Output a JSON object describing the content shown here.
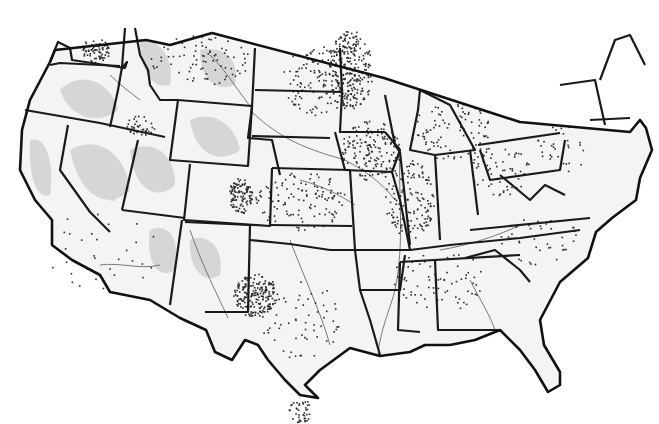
{
  "map": {
    "title": "",
    "subject": "Contiguous United States dot-density map",
    "colors": {
      "background": "#ffffff",
      "land": "#f4f4f4",
      "shaded_region": "#d6d6d6",
      "boundary": "#1a1a1a",
      "river": "#6a6a6a",
      "dot": "#2a2a2a"
    },
    "outline": "M146,40 L170,45 L212,33 L384,78 L520,122 L630,132 L640,120 L646,128 L652,150 L640,178 L636,200 L612,218 L596,232 L588,258 L560,282 L540,320 L544,345 L560,372 L560,385 L548,392 L535,370 L520,350 L500,330 L475,340 L450,345 L425,345 L410,352 L380,356 L350,348 L320,370 L305,385 L318,398 L300,395 L285,380 L268,360 L258,345 L245,340 L232,360 L215,352 L206,330 L180,318 L150,300 L110,292 L100,275 L72,260 L52,245 L52,220 L35,200 L20,170 L22,130 L30,100 L50,62 L55,50 Z",
    "states": [
      {
        "name": "washington",
        "path": "M50,62 L58,42 L70,48 L72,60 L125,68 L127,62 L122,68 L122,70"
      },
      {
        "name": "wa-or",
        "path": "M50,65 L60,63 L120,66"
      },
      {
        "name": "or-ca-nv",
        "path": "M25,110 L100,123 L165,137"
      },
      {
        "name": "id-west",
        "path": "M125,28 L122,67 L118,90 L110,127"
      },
      {
        "name": "id-mt",
        "path": "M135,28 L140,55 L148,70 L150,85 L160,100 L178,100"
      },
      {
        "name": "mt-south",
        "path": "M178,100 L252,106"
      },
      {
        "name": "wy",
        "path": "M178,100 L170,160 L248,166 L252,106"
      },
      {
        "name": "nv-east",
        "path": "M138,140 L122,210"
      },
      {
        "name": "nv-ca",
        "path": "M68,125 L60,170 L90,212 L110,232"
      },
      {
        "name": "ut-az",
        "path": "M122,210 L185,218"
      },
      {
        "name": "co",
        "path": "M190,164 L184,220 L270,226 L272,168"
      },
      {
        "name": "az-nm",
        "path": "M182,220 L170,305"
      },
      {
        "name": "nm-tx",
        "path": "M185,222 L250,225 L248,312 L205,312"
      },
      {
        "name": "nd-sd-ne",
        "path": "M255,48 L252,107 L248,138 L272,140 L280,175"
      },
      {
        "name": "nd-sd",
        "path": "M255,90 L342,92"
      },
      {
        "name": "sd-ne",
        "path": "M252,136 L330,138"
      },
      {
        "name": "ne-ks",
        "path": "M272,168 L350,170"
      },
      {
        "name": "ks-ok",
        "path": "M270,225 L352,226"
      },
      {
        "name": "ok-tx",
        "path": "M250,240 L290,244 L330,250 L355,250"
      },
      {
        "name": "mn",
        "path": "M340,48 L342,92 L340,132 L385,132"
      },
      {
        "name": "ia",
        "path": "M335,132 L345,170 L392,172 L400,150 L385,132"
      },
      {
        "name": "mo",
        "path": "M350,170 L355,250 L410,250 L400,200 L392,172"
      },
      {
        "name": "ar-la",
        "path": "M355,250 L360,290 L400,290 L405,255"
      },
      {
        "name": "la",
        "path": "M360,290 L370,320 L380,355"
      },
      {
        "name": "ms-al",
        "path": "M400,262 L398,330 L420,332"
      },
      {
        "name": "al-ga",
        "path": "M435,260 L438,330 L498,330"
      },
      {
        "name": "ga-sc-fl",
        "path": "M465,258 L495,250 L520,270 L530,282"
      },
      {
        "name": "tn",
        "path": "M400,262 L520,255"
      },
      {
        "name": "ky-tn-nc",
        "path": "M410,250 L450,245 L520,238 L580,230"
      },
      {
        "name": "wi-il",
        "path": "M385,95 L395,145 L400,152"
      },
      {
        "name": "il-in",
        "path": "M400,152 L410,245"
      },
      {
        "name": "in-oh",
        "path": "M435,155 L440,240"
      },
      {
        "name": "oh-pa",
        "path": "M470,150 L478,215"
      },
      {
        "name": "mi-lower",
        "path": "M420,90 L450,105 L475,150 L435,155 L410,150 L418,110 Z"
      },
      {
        "name": "pa-ny",
        "path": "M478,145 L560,133"
      },
      {
        "name": "pa",
        "path": "M480,150 L490,180 L560,170 L565,140"
      },
      {
        "name": "ny-vt",
        "path": "M560,85 L595,80 L605,125"
      },
      {
        "name": "nh-me",
        "path": "M600,80 L615,40 L630,35 L645,65"
      },
      {
        "name": "ma-ct",
        "path": "M590,120 L630,118"
      },
      {
        "name": "va-wv",
        "path": "M500,175 L530,200 L545,185 L565,195"
      },
      {
        "name": "va-nc",
        "path": "M470,230 L590,218"
      }
    ],
    "shaded_regions": [
      {
        "path": "M60,90 C80,70 110,80 118,110 C100,125 70,120 60,90 Z"
      },
      {
        "path": "M70,150 C95,135 125,150 130,190 C110,210 80,200 70,150 Z"
      },
      {
        "path": "M130,150 C150,140 175,150 175,185 C160,200 135,195 130,150 Z"
      },
      {
        "path": "M190,120 C215,110 235,125 240,150 C220,165 195,155 190,120 Z"
      },
      {
        "path": "M150,230 C170,222 180,240 175,270 C160,280 145,265 150,230 Z"
      },
      {
        "path": "M190,240 C205,232 225,245 220,275 C205,285 188,270 190,240 Z"
      },
      {
        "path": "M30,140 C45,135 55,160 50,195 C38,200 28,180 30,140 Z"
      },
      {
        "path": "M140,40 C160,38 175,60 170,85 C152,90 140,70 140,40 Z"
      },
      {
        "path": "M200,50 C225,45 240,60 235,85 C215,92 200,80 200,50 Z"
      },
      {
        "path": "M105,170 C112,165 118,180 115,200 C108,205 102,190 105,170 Z"
      }
    ],
    "rivers": [
      "M250,110 C280,140 310,150 345,160 C360,168 380,180 395,200",
      "M400,150 C398,200 405,240 395,290 C390,310 380,330 378,355",
      "M190,230 C200,260 215,290 228,318",
      "M160,265 C140,270 120,262 100,265",
      "M290,240 C305,280 320,310 330,345",
      "M440,250 C470,245 500,235 520,225",
      "M210,55 C230,75 240,95 252,108",
      "M110,75 C120,85 130,92 140,100",
      "M470,280 C480,300 490,315 495,330",
      "M300,180 C320,185 340,195 355,205"
    ],
    "dot_clusters": [
      {
        "cx": 350,
        "cy": 70,
        "rx": 22,
        "ry": 40,
        "count": 240
      },
      {
        "cx": 255,
        "cy": 295,
        "rx": 22,
        "ry": 22,
        "count": 200
      },
      {
        "cx": 240,
        "cy": 195,
        "rx": 12,
        "ry": 18,
        "count": 110
      },
      {
        "cx": 95,
        "cy": 50,
        "rx": 15,
        "ry": 12,
        "count": 70
      },
      {
        "cx": 320,
        "cy": 80,
        "rx": 40,
        "ry": 35,
        "count": 140
      },
      {
        "cx": 370,
        "cy": 150,
        "rx": 30,
        "ry": 30,
        "count": 160
      },
      {
        "cx": 410,
        "cy": 200,
        "rx": 25,
        "ry": 40,
        "count": 140
      },
      {
        "cx": 200,
        "cy": 60,
        "rx": 50,
        "ry": 25,
        "count": 80
      },
      {
        "cx": 300,
        "cy": 200,
        "rx": 45,
        "ry": 30,
        "count": 120
      },
      {
        "cx": 450,
        "cy": 130,
        "rx": 40,
        "ry": 30,
        "count": 90
      },
      {
        "cx": 500,
        "cy": 170,
        "rx": 30,
        "ry": 25,
        "count": 60
      },
      {
        "cx": 440,
        "cy": 280,
        "rx": 50,
        "ry": 30,
        "count": 70
      },
      {
        "cx": 300,
        "cy": 320,
        "rx": 40,
        "ry": 40,
        "count": 60
      },
      {
        "cx": 300,
        "cy": 410,
        "rx": 12,
        "ry": 12,
        "count": 40
      },
      {
        "cx": 140,
        "cy": 125,
        "rx": 15,
        "ry": 10,
        "count": 35
      },
      {
        "cx": 100,
        "cy": 250,
        "rx": 60,
        "ry": 40,
        "count": 30
      },
      {
        "cx": 540,
        "cy": 240,
        "rx": 40,
        "ry": 25,
        "count": 40
      },
      {
        "cx": 560,
        "cy": 150,
        "rx": 25,
        "ry": 25,
        "count": 30
      }
    ]
  }
}
